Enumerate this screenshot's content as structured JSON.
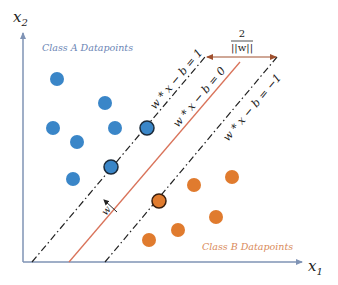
{
  "diagram": {
    "axes": {
      "x_label": "x",
      "x_subscript": "1",
      "y_label": "x",
      "y_subscript": "2",
      "color": "#7f93b5"
    },
    "classes": [
      {
        "name": "Class A Datapoints",
        "color": "#3a86c8",
        "label_color": "#6b85b5"
      },
      {
        "name": "Class B Datapoints",
        "color": "#e07b2e",
        "label_color": "#d98a5a"
      }
    ],
    "lines": [
      {
        "id": "upper-margin",
        "equation": "w * x − b = 1",
        "style": "dash-dot",
        "color": "#222222"
      },
      {
        "id": "hyperplane",
        "equation": "w * x − b = 0",
        "style": "solid",
        "color": "#d9735a"
      },
      {
        "id": "lower-margin",
        "equation": "w * x − b = −1",
        "style": "dash-dot",
        "color": "#222222"
      }
    ],
    "margin_annotation": {
      "numerator": "2",
      "denominator": "||w||",
      "color": "#a0502e"
    },
    "normal_vector": {
      "label": "w"
    },
    "points": {
      "class_a": [
        {
          "x": 57,
          "y": 79,
          "support": false
        },
        {
          "x": 105,
          "y": 103,
          "support": false
        },
        {
          "x": 53,
          "y": 128,
          "support": false
        },
        {
          "x": 115,
          "y": 128,
          "support": false
        },
        {
          "x": 77,
          "y": 142,
          "support": false
        },
        {
          "x": 73,
          "y": 179,
          "support": false
        },
        {
          "x": 147,
          "y": 128,
          "support": true
        },
        {
          "x": 111,
          "y": 167,
          "support": true
        }
      ],
      "class_b": [
        {
          "x": 194,
          "y": 185,
          "support": false
        },
        {
          "x": 232,
          "y": 177,
          "support": false
        },
        {
          "x": 216,
          "y": 217,
          "support": false
        },
        {
          "x": 178,
          "y": 230,
          "support": false
        },
        {
          "x": 149,
          "y": 240,
          "support": false
        },
        {
          "x": 159,
          "y": 201,
          "support": true
        }
      ]
    }
  }
}
